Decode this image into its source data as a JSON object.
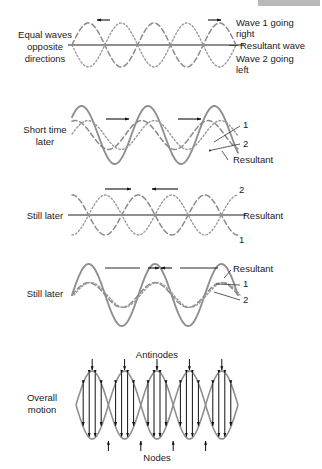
{
  "figure": {
    "title_bar": {
      "present": true,
      "color": "#b9b9b9"
    },
    "panels": [
      {
        "id": "panel-equal-waves",
        "left_label": [
          "Equal waves",
          "opposite",
          "directions"
        ],
        "right_labels": [
          {
            "key": "wave1",
            "lines": [
              "Wave 1 going",
              "right"
            ]
          },
          {
            "key": "resultant",
            "lines": [
              "Resultant wave"
            ]
          },
          {
            "key": "wave2",
            "lines": [
              "Wave 2 going",
              "left"
            ]
          }
        ],
        "resultant_state": "flat",
        "arrows": [
          {
            "dir": "left",
            "x": 110,
            "y": 20
          },
          {
            "dir": "right",
            "x": 208,
            "y": 20
          }
        ]
      },
      {
        "id": "panel-short-time-later",
        "left_label": [
          "Short time",
          "later"
        ],
        "right_labels": [
          {
            "key": "one",
            "lines": [
              "1"
            ]
          },
          {
            "key": "two",
            "lines": [
              "2"
            ]
          },
          {
            "key": "resultant",
            "lines": [
              "Resultant"
            ]
          }
        ],
        "resultant_state": "large",
        "arrows": [
          {
            "dir": "right",
            "x": 118,
            "y": 119
          },
          {
            "dir": "right",
            "x": 190,
            "y": 119
          }
        ]
      },
      {
        "id": "panel-still-later-flat",
        "left_label": [
          "Still later"
        ],
        "right_labels": [
          {
            "key": "two",
            "lines": [
              "2"
            ]
          },
          {
            "key": "resultant",
            "lines": [
              "Resultant"
            ]
          },
          {
            "key": "one",
            "lines": [
              "1"
            ]
          }
        ],
        "resultant_state": "flat",
        "arrows": [
          {
            "dir": "right",
            "x": 105,
            "y": 189
          },
          {
            "dir": "left",
            "x": 178,
            "y": 189
          }
        ]
      },
      {
        "id": "panel-still-later-max",
        "left_label": [
          "Still later"
        ],
        "right_labels": [
          {
            "key": "resultant",
            "lines": [
              "Resultant"
            ]
          },
          {
            "key": "one",
            "lines": [
              "1"
            ]
          },
          {
            "key": "two",
            "lines": [
              "2"
            ]
          }
        ],
        "resultant_state": "large",
        "arrows": [
          {
            "dir": "converge",
            "x": 160,
            "y": 268
          }
        ]
      },
      {
        "id": "panel-overall-motion",
        "left_label": [
          "Overall",
          "motion"
        ],
        "top_label": "Antinodes",
        "bottom_label": "Nodes",
        "right_labels": [],
        "resultant_state": "envelope",
        "arrows": []
      }
    ]
  },
  "chart_data": {
    "type": "line",
    "xlabel": "",
    "ylabel": "",
    "grid": false,
    "legend_position": "right",
    "x_range": [
      0,
      1
    ],
    "wavelengths_shown": 2.5,
    "panels": [
      {
        "name": "Equal waves opposite directions",
        "phase_deg": 0,
        "series": [
          {
            "name": "Wave 1 going right",
            "style": "dashed",
            "amplitude": 1.0,
            "phase_deg": 0,
            "direction": "right"
          },
          {
            "name": "Wave 2 going left",
            "style": "dotted",
            "amplitude": 1.0,
            "phase_deg": 180,
            "direction": "left"
          },
          {
            "name": "Resultant wave",
            "style": "solid",
            "amplitude": 0.0
          }
        ]
      },
      {
        "name": "Short time later",
        "phase_deg": 45,
        "series": [
          {
            "name": "1",
            "style": "dashed",
            "amplitude": 1.0,
            "phase_deg": 45,
            "direction": "right"
          },
          {
            "name": "2",
            "style": "dotted",
            "amplitude": 1.0,
            "phase_deg": -45,
            "direction": "left"
          },
          {
            "name": "Resultant",
            "style": "solid",
            "amplitude": 1.41
          }
        ]
      },
      {
        "name": "Still later",
        "phase_deg": 90,
        "series": [
          {
            "name": "1",
            "style": "dotted",
            "amplitude": 1.0,
            "phase_deg": 90,
            "direction": "right"
          },
          {
            "name": "2",
            "style": "dashed",
            "amplitude": 1.0,
            "phase_deg": -90,
            "direction": "left"
          },
          {
            "name": "Resultant",
            "style": "solid",
            "amplitude": 0.0
          }
        ]
      },
      {
        "name": "Still later",
        "phase_deg": 180,
        "series": [
          {
            "name": "1",
            "style": "dashed",
            "amplitude": 1.0,
            "phase_deg": 180,
            "direction": "right"
          },
          {
            "name": "2",
            "style": "dotted",
            "amplitude": 1.0,
            "phase_deg": 180,
            "direction": "left"
          },
          {
            "name": "Resultant",
            "style": "solid",
            "amplitude": 2.0
          }
        ]
      },
      {
        "name": "Overall motion",
        "series": [
          {
            "name": "Envelope upper",
            "style": "solid",
            "amplitude": 2.0
          },
          {
            "name": "Envelope lower",
            "style": "solid",
            "amplitude": -2.0
          }
        ],
        "antinodes": 5,
        "nodes": 4
      }
    ]
  }
}
